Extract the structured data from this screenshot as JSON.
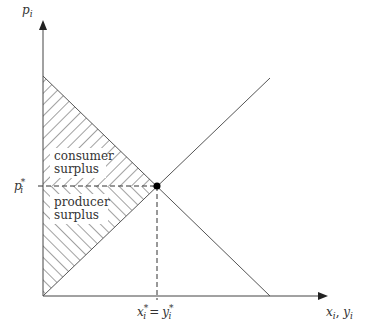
{
  "diagram": {
    "y_axis_label": "p",
    "y_axis_sub": "i",
    "x_axis_label": "x",
    "x_axis_sub": "i",
    "x_axis_label2": "y",
    "x_axis_sub2": "i",
    "price_label": "p",
    "price_sub": "i",
    "price_sup": "*",
    "qty_label_x": "x",
    "qty_label_y": "y",
    "qty_sub": "i",
    "qty_sup": "*",
    "equals": "=",
    "consumer_line1": "consumer",
    "consumer_line2": "surplus",
    "producer_line1": "producer",
    "producer_line2": "surplus",
    "line_color": "#555555"
  }
}
